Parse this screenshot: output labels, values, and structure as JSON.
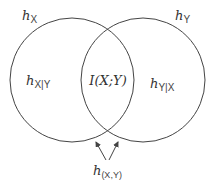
{
  "diagram": {
    "type": "venn",
    "title": "",
    "sets": [
      {
        "name": "X",
        "label_main": "h",
        "label_sub": "X"
      },
      {
        "name": "Y",
        "label_main": "h",
        "label_sub": "Y"
      }
    ],
    "regions": {
      "x_only": {
        "main": "h",
        "sub": "X|Y"
      },
      "intersection": {
        "text": "I(X;Y)"
      },
      "y_only": {
        "main": "h",
        "sub": "Y|X"
      }
    },
    "joint": {
      "main": "h",
      "sub": "(X,Y)"
    },
    "colors": {
      "stroke": "#444444",
      "text": "#333333",
      "background": "#ffffff"
    }
  }
}
